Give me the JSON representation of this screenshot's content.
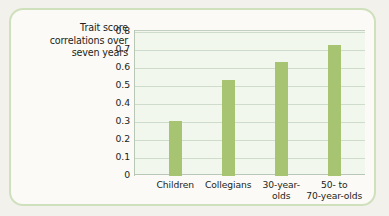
{
  "figure": {
    "frame_color": "#cfe0bc",
    "page_background": "#f3f1ec"
  },
  "chart_data": {
    "type": "bar",
    "title": "",
    "xlabel": "",
    "ylabel": "Trait score correlations over seven years",
    "ylabel_lines": [
      "Trait score",
      "correlations over",
      "seven years"
    ],
    "categories": [
      "Children",
      "Collegians",
      "30-year-olds",
      "50- to 70-year-olds"
    ],
    "category_lines": [
      [
        "Children"
      ],
      [
        "Collegians"
      ],
      [
        "30-year-",
        "olds"
      ],
      [
        "50-  to",
        "70-year-olds"
      ]
    ],
    "values": [
      0.305,
      0.535,
      0.635,
      0.73
    ],
    "ylim": [
      0,
      0.81
    ],
    "yticks": [
      0.8,
      0.7,
      0.6,
      0.5,
      0.4,
      0.3,
      0.2,
      0.1,
      0
    ],
    "ytick_labels": [
      "0.8",
      "0.7",
      "0.6",
      "0.5",
      "0.4",
      "0.3",
      "0.2",
      "0.1",
      "0"
    ],
    "grid": true,
    "legend": "none",
    "bar_color": "#a6c472",
    "plot_background": "#f2f7ee",
    "gridline_color": "#cfdccc"
  }
}
